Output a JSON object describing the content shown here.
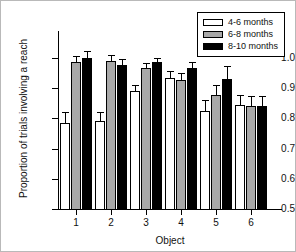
{
  "chart_data": {
    "type": "bar",
    "title": "",
    "xlabel": "Object",
    "ylabel": "Proportion of trials involving a reach",
    "categories": [
      "1",
      "2",
      "3",
      "4",
      "5",
      "6"
    ],
    "ylim": [
      0.5,
      1.0
    ],
    "yticks": [
      "0.5",
      "0.6",
      "0.7",
      "0.8",
      "0.9",
      "1.0"
    ],
    "ytick_values": [
      0.5,
      0.6,
      0.7,
      0.8,
      0.9,
      1.0
    ],
    "grid": false,
    "legend_position": "top-right",
    "series": [
      {
        "name": "4-6 months",
        "color": "#ffffff",
        "style": "white",
        "values": [
          0.785,
          0.79,
          0.89,
          0.935,
          0.825,
          0.843
        ],
        "errors": [
          0.037,
          0.03,
          0.02,
          0.022,
          0.035,
          0.035
        ]
      },
      {
        "name": "6-8 months",
        "color": "#a8a8a8",
        "style": "gray",
        "values": [
          0.986,
          0.99,
          0.966,
          0.927,
          0.878,
          0.84
        ],
        "errors": [
          0.02,
          0.02,
          0.017,
          0.022,
          0.032,
          0.035
        ]
      },
      {
        "name": "8-10 months",
        "color": "#000000",
        "style": "black",
        "values": [
          1.0,
          0.977,
          0.986,
          0.968,
          0.932,
          0.84
        ],
        "errors": [
          0.022,
          0.02,
          0.015,
          0.02,
          0.042,
          0.035
        ]
      }
    ]
  },
  "legend": {
    "entries": [
      {
        "label": "4-6 months",
        "style": "white"
      },
      {
        "label": "6-8 months",
        "style": "gray"
      },
      {
        "label": "8-10 months",
        "style": "black"
      }
    ]
  }
}
